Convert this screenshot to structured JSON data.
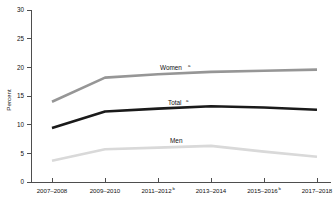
{
  "chart_data": {
    "type": "line",
    "title": "",
    "xlabel": "",
    "ylabel": "Percent",
    "ylim": [
      0,
      30
    ],
    "yticks": [
      0,
      5,
      10,
      15,
      20,
      25,
      30
    ],
    "grid": false,
    "legend": "inline-labels",
    "categories": [
      "2007–2008",
      "2009–2010",
      "2011–2012",
      "2013–2014",
      "2015–2016",
      "2017–2018"
    ],
    "category_superscripts": [
      "",
      "",
      "b",
      "",
      "b",
      ""
    ],
    "series": [
      {
        "name": "Women",
        "superscript": "a",
        "color": "#969696",
        "values": [
          14.0,
          18.2,
          18.8,
          19.2,
          19.4,
          19.6
        ]
      },
      {
        "name": "Total",
        "superscript": "a",
        "color": "#1a1a1a",
        "values": [
          9.4,
          12.3,
          12.8,
          13.2,
          13.0,
          12.6
        ]
      },
      {
        "name": "Men",
        "superscript": "",
        "color": "#d9d9d9",
        "values": [
          3.7,
          5.7,
          6.0,
          6.3,
          5.3,
          4.4
        ]
      }
    ]
  },
  "axis": {
    "y_label": "Percent",
    "y_tick_0": "0",
    "y_tick_5": "5",
    "y_tick_10": "10",
    "y_tick_15": "15",
    "y_tick_20": "20",
    "y_tick_25": "25",
    "y_tick_30": "30"
  },
  "x_labels": {
    "t0": "2007–2008",
    "t1": "2009–2010",
    "t2": "2011–2012",
    "t2_sup": "b",
    "t3": "2013–2014",
    "t4": "2015–2016",
    "t4_sup": "b",
    "t5": "2017–2018"
  },
  "series_labels": {
    "women": "Women",
    "women_sup": "a",
    "total": "Total",
    "total_sup": "a",
    "men": "Men"
  }
}
